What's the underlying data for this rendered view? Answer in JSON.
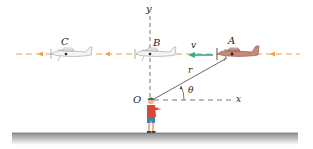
{
  "figure": {
    "labels": {
      "y_axis": "y",
      "x_axis": "x",
      "origin": "O",
      "plane_a": "A",
      "plane_b": "B",
      "plane_c": "C",
      "velocity": "v",
      "radius": "r",
      "angle": "θ"
    },
    "colors": {
      "flight_path": "#f0a040",
      "velocity_arrow": "#3aa88a",
      "plane_a_body": "#c98a7a",
      "plane_ghost": "#d8d8d8",
      "ground": "#9a9a9a",
      "axis": "#555555",
      "boy_shirt": "#d9473a",
      "boy_shorts": "#4a7fa8",
      "boy_cap": "#3f6f4f"
    },
    "planes": [
      {
        "id": "A",
        "style": "solid"
      },
      {
        "id": "B",
        "style": "ghost"
      },
      {
        "id": "C",
        "style": "ghost"
      }
    ]
  }
}
